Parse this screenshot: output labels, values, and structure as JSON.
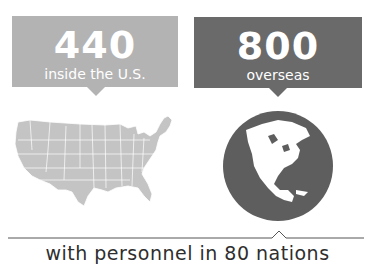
{
  "stats": [
    {
      "value": "440",
      "label": "inside the U.S.",
      "color": "#b3b3b3",
      "icon": "us-map-icon"
    },
    {
      "value": "800",
      "label": "overseas",
      "color": "#6a6a6a",
      "icon": "globe-icon"
    }
  ],
  "footer": {
    "tagline": "with personnel in 80 nations"
  },
  "colors": {
    "light_gray": "#b3b3b3",
    "dark_gray": "#6a6a6a",
    "text": "#2e2e2e",
    "line": "#555555"
  }
}
